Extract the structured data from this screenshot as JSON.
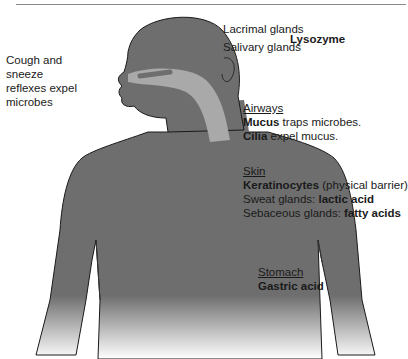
{
  "figure": {
    "colors": {
      "body": "#6e6e6e",
      "body_dark": "#555555",
      "organ_light": "#a9a9a9",
      "liver": "#4a4a4a",
      "stomach": "#b8b8b8",
      "outline": "#1a1a1a",
      "text": "#1a1a1a"
    }
  },
  "labels": {
    "cough": {
      "text": "Cough and sneeze reflexes expel microbes"
    },
    "lacrimal": {
      "text": "Lacrimal glands"
    },
    "salivary": {
      "text": "Salivary glands"
    },
    "lysozyme": {
      "text": "Lysozyme"
    },
    "airways": {
      "heading": "Airways",
      "line1_bold": "Mucus",
      "line1_rest": " traps microbes.",
      "line2_bold": "Cilia",
      "line2_rest": " expel mucus."
    },
    "skin": {
      "heading": "Skin",
      "line1_bold": "Keratinocytes",
      "line1_rest": " (physical barrier)",
      "line2_pre": "Sweat glands: ",
      "line2_bold": "lactic acid",
      "line3_pre": "Sebaceous glands: ",
      "line3_bold": "fatty acids"
    },
    "stomach": {
      "heading": "Stomach",
      "line1_bold": "Gastric acid"
    }
  }
}
